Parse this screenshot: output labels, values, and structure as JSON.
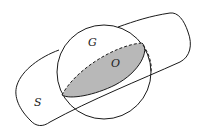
{
  "figure": {
    "labels": {
      "sphere": "G",
      "region": "O",
      "surface": "S"
    },
    "colors": {
      "stroke": "#1a1a1a",
      "shade": "#b8b8b8",
      "background": "#ffffff"
    }
  }
}
